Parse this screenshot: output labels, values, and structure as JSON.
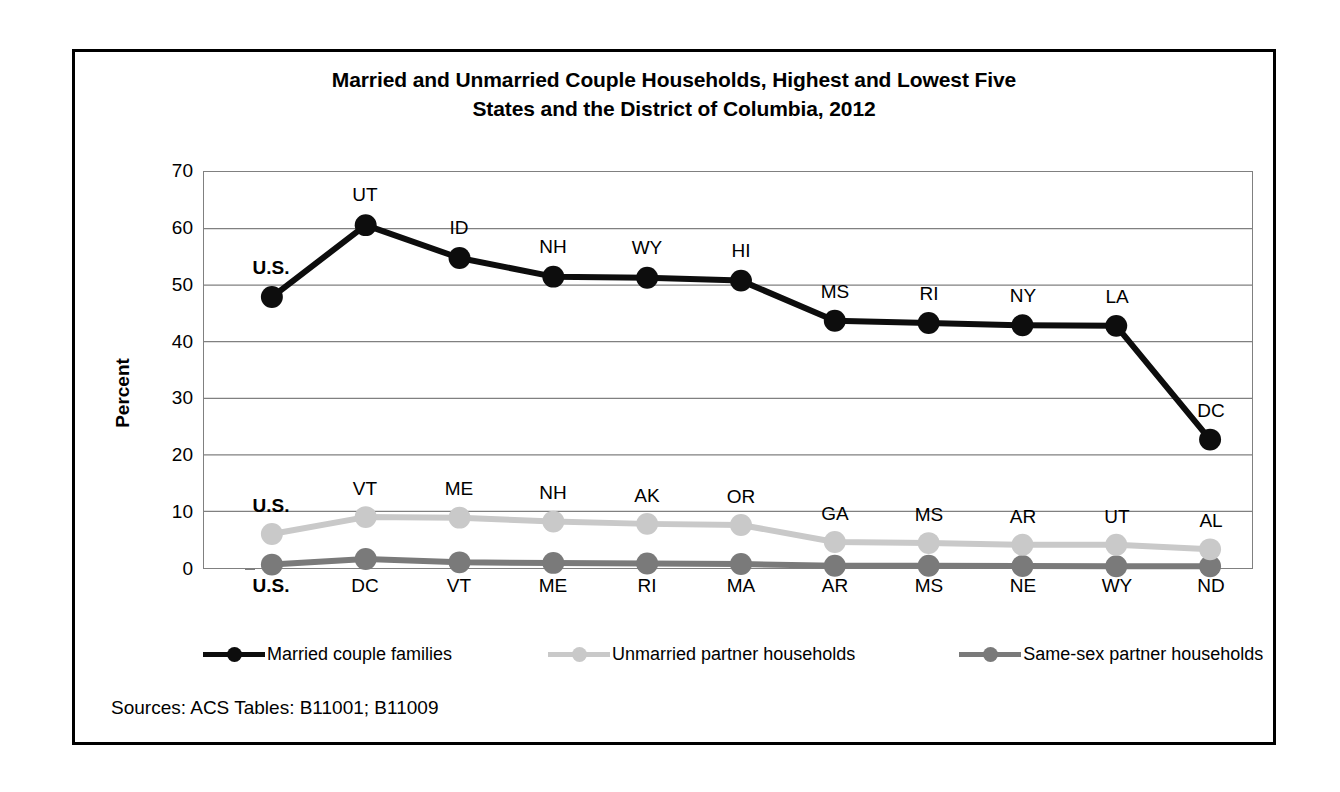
{
  "figure": {
    "title_line1": "Married and Unmarried Couple Households, Highest and Lowest Five",
    "title_line2": "States and the District of Columbia, 2012",
    "source": "Sources: ACS Tables: B11001; B11009"
  },
  "colors": {
    "married": "#0d0d0d",
    "unmarried": "#c9c9c9",
    "same_sex": "#7a7a7a",
    "gridline": "#808080",
    "frame": "#000000",
    "background": "#ffffff"
  },
  "chart_data": {
    "type": "line",
    "title": "Married and Unmarried Couple Households, Highest and Lowest Five States and the District of Columbia, 2012",
    "xlabel": "",
    "ylabel": "Percent",
    "ylim": [
      0,
      70
    ],
    "ytick_labels": [
      "70",
      "60",
      "50",
      "40",
      "30",
      "20",
      "10",
      "0"
    ],
    "yticks": [
      70,
      60,
      50,
      40,
      30,
      20,
      10,
      0
    ],
    "grid": true,
    "legend_position": "below-plot",
    "x_count": 11,
    "x": [
      1,
      2,
      3,
      4,
      5,
      6,
      7,
      8,
      9,
      10,
      11
    ],
    "axis_tick_labels": [
      "U.S.",
      "DC",
      "VT",
      "ME",
      "RI",
      "MA",
      "AR",
      "MS",
      "NE",
      "WY",
      "ND"
    ],
    "axis_tick_bold": [
      true,
      false,
      false,
      false,
      false,
      false,
      false,
      false,
      false,
      false,
      false
    ],
    "series": [
      {
        "name": "Married couple families",
        "color": "#0d0d0d",
        "values": [
          47.9,
          60.6,
          54.8,
          51.5,
          51.3,
          50.8,
          43.7,
          43.3,
          42.9,
          42.8,
          22.7
        ],
        "point_labels": [
          "U.S.",
          "UT",
          "ID",
          "NH",
          "WY",
          "HI",
          "MS",
          "RI",
          "NY",
          "LA",
          "DC"
        ],
        "point_label_bold": [
          true,
          false,
          false,
          false,
          false,
          false,
          false,
          false,
          false,
          false,
          false
        ]
      },
      {
        "name": "Unmarried partner households",
        "color": "#c9c9c9",
        "values": [
          6.0,
          9.0,
          8.9,
          8.2,
          7.8,
          7.6,
          4.6,
          4.4,
          4.1,
          4.1,
          3.3
        ],
        "point_labels": [
          "U.S.",
          "VT",
          "ME",
          "NH",
          "AK",
          "OR",
          "GA",
          "MS",
          "AR",
          "UT",
          "AL"
        ],
        "point_label_bold": [
          true,
          false,
          false,
          false,
          false,
          false,
          false,
          false,
          false,
          false,
          false
        ]
      },
      {
        "name": "Same-sex partner households",
        "color": "#7a7a7a",
        "values": [
          0.6,
          1.6,
          1.0,
          0.9,
          0.8,
          0.7,
          0.4,
          0.4,
          0.35,
          0.3,
          0.3
        ],
        "point_labels": [
          "",
          "",
          "",
          "",
          "",
          "",
          "",
          "",
          "",
          "",
          ""
        ],
        "point_label_bold": [
          false,
          false,
          false,
          false,
          false,
          false,
          false,
          false,
          false,
          false,
          false
        ]
      }
    ]
  },
  "legend": {
    "items": [
      {
        "label": "Married couple families",
        "color": "#0d0d0d"
      },
      {
        "label": "Unmarried partner households",
        "color": "#c9c9c9"
      },
      {
        "label": "Same-sex partner households",
        "color": "#7a7a7a"
      }
    ]
  }
}
